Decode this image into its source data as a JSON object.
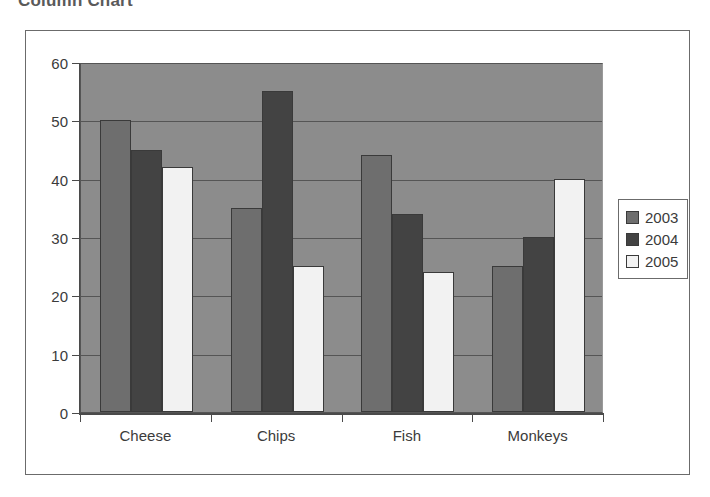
{
  "page": {
    "title": "Column Chart"
  },
  "chart_data": {
    "type": "bar",
    "title": "Column Chart",
    "xlabel": "",
    "ylabel": "",
    "categories": [
      "Cheese",
      "Chips",
      "Fish",
      "Monkeys"
    ],
    "series": [
      {
        "name": "2003",
        "color": "#6e6e6e",
        "values": [
          50,
          35,
          44,
          25
        ]
      },
      {
        "name": "2004",
        "color": "#434343",
        "values": [
          45,
          55,
          34,
          30
        ]
      },
      {
        "name": "2005",
        "color": "#f2f2f2",
        "values": [
          42,
          25,
          24,
          40
        ]
      }
    ],
    "ylim": [
      0,
      60
    ],
    "yticks": [
      0,
      10,
      20,
      30,
      40,
      50,
      60
    ],
    "ytick_labels": [
      "0",
      "10",
      "20",
      "30",
      "40",
      "50",
      "60"
    ],
    "grid": true,
    "grid_axis": "y",
    "legend_position": "right",
    "plot_background": "#8c8c8c",
    "frame_color": "#6b6b6b"
  }
}
